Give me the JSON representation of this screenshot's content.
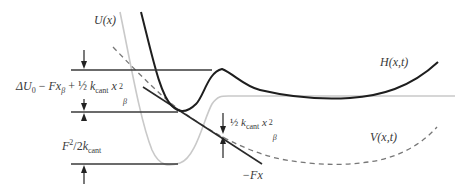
{
  "diagram": {
    "type": "energy-landscape",
    "curves": [
      {
        "id": "U",
        "label": "U(x)",
        "style": "solid",
        "color": "#c8c8c8"
      },
      {
        "id": "H",
        "label": "H(x,t)",
        "style": "solid",
        "color": "#1e1e1e"
      },
      {
        "id": "V",
        "label": "V(x,t)",
        "style": "dashed",
        "color": "#6e6e6e"
      },
      {
        "id": "Fx",
        "label": "−Fx",
        "style": "solid",
        "color": "#2a2a2a"
      }
    ],
    "labels": {
      "u": "U(x)",
      "h": "H(x,t)",
      "v": "V(x,t)",
      "fx": "−Fx",
      "barrier": {
        "delta": "ΔU",
        "sub0": "0",
        "minus": " − ",
        "F": "F",
        "x": "x",
        "beta": "β",
        "plus": " + ",
        "half": "½",
        "k": "k",
        "cant": "cant",
        "sq": "2"
      },
      "spring": {
        "half": "½",
        "k": "k",
        "cant": "cant",
        "x": "x",
        "sq": "2",
        "beta": "β"
      },
      "force": {
        "F": "F",
        "sq": "2",
        "slash": "/2",
        "k": "k",
        "cant": "cant"
      }
    }
  }
}
